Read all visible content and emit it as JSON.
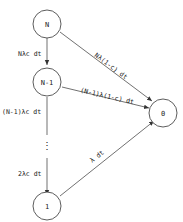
{
  "diagram": {
    "nodes": [
      {
        "id": "N",
        "label": "N"
      },
      {
        "id": "N-1",
        "label": "N-1"
      },
      {
        "id": "dots",
        "label": "⋮"
      },
      {
        "id": "1",
        "label": "1"
      },
      {
        "id": "0",
        "label": "0"
      }
    ],
    "edges": [
      {
        "from": "N",
        "to": "N-1",
        "label": "Nλc dt"
      },
      {
        "from": "N-1",
        "to": "dots",
        "label": "(N-1)λc dt"
      },
      {
        "from": "dots",
        "to": "1",
        "label": "2λc dt"
      },
      {
        "from": "N",
        "to": "0",
        "label": "Nλ(1-c) dt"
      },
      {
        "from": "N-1",
        "to": "0",
        "label": "(N-1)λ(1-c) dt"
      },
      {
        "from": "1",
        "to": "0",
        "label": "λ dt"
      }
    ]
  }
}
